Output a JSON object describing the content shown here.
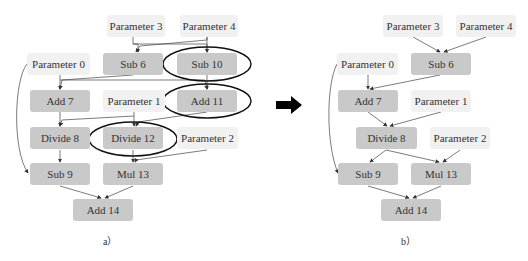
{
  "diagram_a": {
    "caption": "a）",
    "nodes": {
      "param3": "Parameter 3",
      "param4": "Parameter 4",
      "param0": "Parameter 0",
      "sub6": "Sub 6",
      "sub10": "Sub 10",
      "add7": "Add 7",
      "param1": "Parameter 1",
      "add11": "Add 11",
      "divide8": "Divide 8",
      "divide12": "Divide 12",
      "param2": "Parameter 2",
      "sub9": "Sub 9",
      "mul13": "Mul 13",
      "add14": "Add 14"
    },
    "highlighted": [
      "Sub 10",
      "Add 11",
      "Divide 12"
    ]
  },
  "diagram_b": {
    "caption": "b）",
    "nodes": {
      "param3": "Parameter 3",
      "param4": "Parameter 4",
      "param0": "Parameter 0",
      "sub6": "Sub 6",
      "add7": "Add 7",
      "param1": "Parameter 1",
      "divide8": "Divide 8",
      "param2": "Parameter 2",
      "sub9": "Sub 9",
      "mul13": "Mul 13",
      "add14": "Add 14"
    }
  },
  "transition_arrow": "right-arrow",
  "colors": {
    "op_node": "#c9c9c9",
    "param_node": "#f1f1f1",
    "edge": "#333333"
  }
}
